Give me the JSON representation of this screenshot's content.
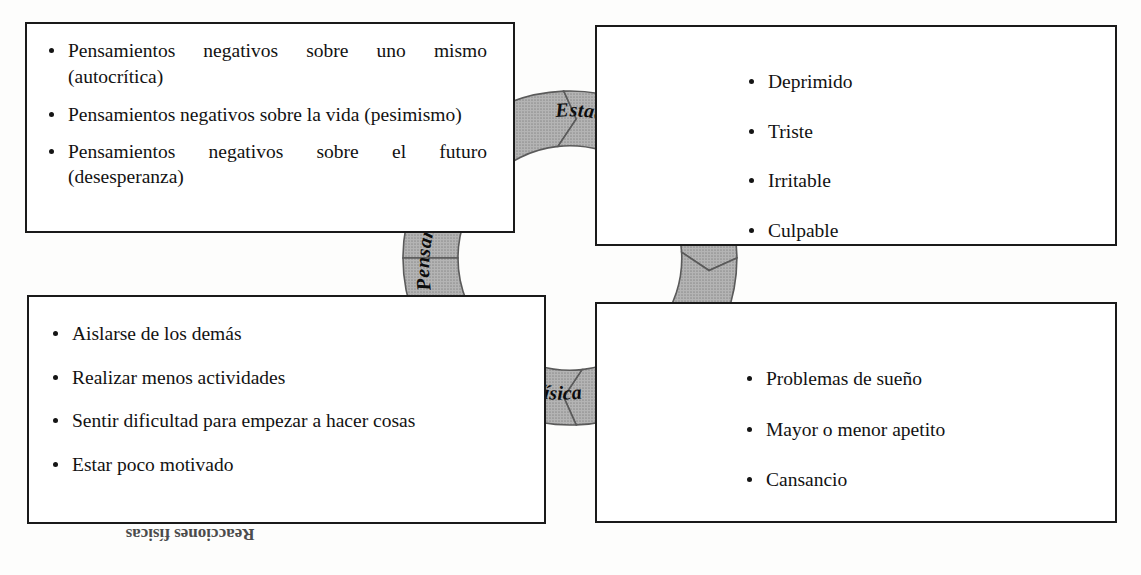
{
  "diagram": {
    "ring": {
      "fill_color": "#a9a9a9",
      "stroke_color": "#4a4a4a",
      "segments": [
        {
          "id": "pensamientos",
          "label": "Pensamientos"
        },
        {
          "id": "estados-de-animo",
          "label": "Estados de ánimo"
        },
        {
          "id": "conductas",
          "label": "Conductas"
        },
        {
          "id": "reacciones-fisicas",
          "label": "Reacciones físicas"
        }
      ]
    },
    "boxes": {
      "thoughts": {
        "id": "pensamientos",
        "items": [
          "Pensamientos negativos sobre uno mismo (autocrítica)",
          "Pensamientos negativos sobre la vida (pesimismo)",
          "Pensamientos negativos sobre el futuro (desesperanza)"
        ]
      },
      "moods": {
        "id": "estados-de-animo",
        "items": [
          "Deprimido",
          "Triste",
          "Irritable",
          "Culpable"
        ]
      },
      "behaviors": {
        "id": "conductas",
        "items": [
          "Aislarse de los demás",
          "Realizar menos actividades",
          "Sentir dificultad para empezar a hacer cosas",
          "Estar poco motivado"
        ]
      },
      "physical": {
        "id": "reacciones-fisicas",
        "items": [
          "Problemas de sueño",
          "Mayor o menor apetito",
          "Cansancio"
        ]
      }
    },
    "artifacts": {
      "bleed_through_text": "Reacciones físicas"
    }
  }
}
